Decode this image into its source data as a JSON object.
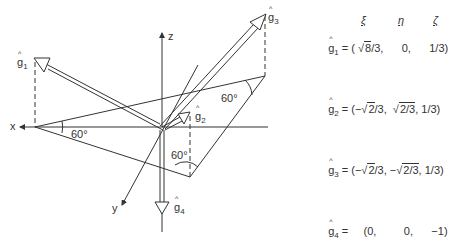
{
  "diagram": {
    "axes": {
      "x": "x",
      "y": "y",
      "z": "z"
    },
    "angles": [
      "60°",
      "60°",
      "60°"
    ],
    "vectors": [
      {
        "name": "g",
        "index": "1"
      },
      {
        "name": "g",
        "index": "2"
      },
      {
        "name": "g",
        "index": "3"
      },
      {
        "name": "g",
        "index": "4"
      }
    ]
  },
  "table": {
    "columns": [
      "ξ",
      "η",
      "ζ"
    ],
    "rows": [
      {
        "vector": "g",
        "index": "1",
        "prefix": " = ( ",
        "c1_root": "8",
        "c1_tail": "/3,",
        "c1_sign": "",
        "c2_root": "",
        "c2_text": "0,",
        "c2_sign": "",
        "c3": "1/3)"
      },
      {
        "vector": "g",
        "index": "2",
        "prefix": " = (−",
        "c1_root": "2",
        "c1_tail": "/3,",
        "c1_sign": "",
        "c2_root": "2/3",
        "c2_text": ",",
        "c2_sign": "",
        "c3": "1/3)"
      },
      {
        "vector": "g",
        "index": "3",
        "prefix": " = (−",
        "c1_root": "2",
        "c1_tail": "/3,",
        "c1_sign": "",
        "c2_root": "2/3",
        "c2_text": ",",
        "c2_sign": "−",
        "c3": "1/3)"
      },
      {
        "vector": "g",
        "index": "4",
        "prefix": " =",
        "c1_text": "(0,",
        "c2_text": "0,",
        "c3": "−1)"
      }
    ]
  }
}
